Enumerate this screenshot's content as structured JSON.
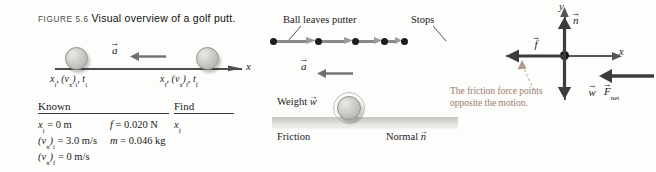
{
  "caption": {
    "figure_number": "FIGURE 5.6",
    "title": "Visual overview of a golf putt."
  },
  "pictorial": {
    "axis_label": "x",
    "acceleration_label": "a",
    "vector_bar": "→",
    "initial_state": {
      "position": "x",
      "position_sub": "i",
      "velocity": "(v",
      "velocity_x": "x",
      "velocity_sub": ")",
      "velocity_sub2": "i",
      "time": "t",
      "time_sub": "i"
    },
    "initial_label_full": "xᵢ, (vₓ)ᵢ, tᵢ",
    "final_label_full": "x_f, (v_x)_f, t_f",
    "ball_initial_name": "golf-ball-initial",
    "ball_final_name": "golf-ball-final"
  },
  "known_find_table": {
    "known_header": "Known",
    "find_header": "Find",
    "rows": [
      {
        "col1": "xᵢ = 0 m",
        "col2": "f = 0.020 N",
        "col3": "xғ"
      },
      {
        "col1": "(vₓ)ᵢ = 3.0 m/s",
        "col2": "m = 0.046 kg",
        "col3": ""
      },
      {
        "col1": "(vₓ)ғ = 0 m/s",
        "col2": "",
        "col3": ""
      }
    ],
    "parts": {
      "x_i": "x",
      "x_i_sub": "i",
      "x_i_val": " = 0 m",
      "f_sym": "f",
      "f_val": " = 0.020 N",
      "vxi_open": "(v",
      "vxi_x": "x",
      "vxi_close": ")",
      "vxi_sub": "i",
      "vxi_val": " = 3.0 m/s",
      "m_sym": "m",
      "m_val": " = 0.046 kg",
      "vxf_open": "(v",
      "vxf_x": "x",
      "vxf_close": ")",
      "vxf_sub": "f",
      "vxf_val": " = 0 m/s",
      "find_x": "x",
      "find_x_sub": "f"
    }
  },
  "motion_diagram": {
    "start_label": "Ball leaves putter",
    "stop_label": "Stops",
    "acceleration_label": "a",
    "dot_count": 5,
    "dot_positions_px": [
      0,
      45,
      82,
      111,
      131
    ],
    "arrow_lengths_px": [
      38,
      31,
      23,
      14
    ]
  },
  "physical_picture": {
    "weight_label": "Weight",
    "weight_symbol": "w",
    "friction_label": "Friction",
    "normal_label": "Normal",
    "normal_symbol": "n"
  },
  "free_body_diagram": {
    "y_axis_label": "y",
    "x_axis_label": "x",
    "normal_symbol": "n",
    "friction_symbol": "f",
    "weight_symbol": "w",
    "net_force_symbol": "F",
    "net_force_sub": "net",
    "annotation": "The friction force points opposite the motion."
  },
  "colors": {
    "page_background": "#fdfdfc",
    "axis_line": "#4d4d4d",
    "motion_dot": "#1d1d1d",
    "motion_arrow": "#8a8a8a",
    "annotation_text": "#9a7b6a",
    "ground": "#d9d9d5",
    "force_arrow": "#555555"
  }
}
